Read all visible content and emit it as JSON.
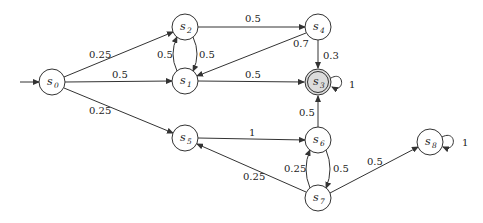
{
  "diagram": {
    "type": "markov-chain",
    "colors": {
      "stroke": "#333333",
      "node_fill": "#ffffff",
      "accepting_fill": "#dcdcdc",
      "background": "#ffffff"
    },
    "initial_state": "s0",
    "nodes": [
      {
        "id": "s0",
        "label": "s",
        "sub": "0",
        "x": 52,
        "y": 82,
        "accepting": false
      },
      {
        "id": "s1",
        "label": "s",
        "sub": "1",
        "x": 185,
        "y": 81,
        "accepting": false
      },
      {
        "id": "s2",
        "label": "s",
        "sub": "2",
        "x": 185,
        "y": 27,
        "accepting": false
      },
      {
        "id": "s3",
        "label": "s",
        "sub": "3",
        "x": 318,
        "y": 82,
        "accepting": true
      },
      {
        "id": "s4",
        "label": "s",
        "sub": "4",
        "x": 318,
        "y": 27,
        "accepting": false
      },
      {
        "id": "s5",
        "label": "s",
        "sub": "5",
        "x": 185,
        "y": 138,
        "accepting": false
      },
      {
        "id": "s6",
        "label": "s",
        "sub": "6",
        "x": 318,
        "y": 140,
        "accepting": false
      },
      {
        "id": "s7",
        "label": "s",
        "sub": "7",
        "x": 318,
        "y": 198,
        "accepting": false
      },
      {
        "id": "s8",
        "label": "s",
        "sub": "8",
        "x": 430,
        "y": 142,
        "accepting": false
      }
    ],
    "edges": [
      {
        "from": "s0",
        "to": "s2",
        "prob": "0.25"
      },
      {
        "from": "s0",
        "to": "s1",
        "prob": "0.5"
      },
      {
        "from": "s0",
        "to": "s5",
        "prob": "0.25"
      },
      {
        "from": "s2",
        "to": "s4",
        "prob": "0.5"
      },
      {
        "from": "s2",
        "to": "s1",
        "prob": "0.5"
      },
      {
        "from": "s1",
        "to": "s2",
        "prob": "0.5"
      },
      {
        "from": "s1",
        "to": "s3",
        "prob": "0.5"
      },
      {
        "from": "s4",
        "to": "s1",
        "prob": "0.7"
      },
      {
        "from": "s4",
        "to": "s3",
        "prob": "0.3"
      },
      {
        "from": "s3",
        "to": "s3",
        "prob": "1"
      },
      {
        "from": "s5",
        "to": "s6",
        "prob": "1"
      },
      {
        "from": "s6",
        "to": "s3",
        "prob": "0.5"
      },
      {
        "from": "s6",
        "to": "s7",
        "prob": "0.5"
      },
      {
        "from": "s7",
        "to": "s6",
        "prob": "0.25"
      },
      {
        "from": "s7",
        "to": "s5",
        "prob": "0.25"
      },
      {
        "from": "s7",
        "to": "s8",
        "prob": "0.5"
      },
      {
        "from": "s8",
        "to": "s8",
        "prob": "1"
      }
    ],
    "labels": {
      "e_s0_s2": "0.25",
      "e_s0_s1": "0.5",
      "e_s0_s5": "0.25",
      "e_s2_s4": "0.5",
      "e_s2_s1": "0.5",
      "e_s1_s2": "0.5",
      "e_s1_s3": "0.5",
      "e_s4_s1": "0.7",
      "e_s4_s3": "0.3",
      "e_s3_s3": "1",
      "e_s5_s6": "1",
      "e_s6_s3": "0.5",
      "e_s6_s7": "0.5",
      "e_s7_s6": "0.25",
      "e_s7_s5": "0.25",
      "e_s7_s8": "0.5",
      "e_s8_s8": "1"
    },
    "node_text": {
      "s0": {
        "name": "s",
        "sub": "0"
      },
      "s1": {
        "name": "s",
        "sub": "1"
      },
      "s2": {
        "name": "s",
        "sub": "2"
      },
      "s3": {
        "name": "s",
        "sub": "3"
      },
      "s4": {
        "name": "s",
        "sub": "4"
      },
      "s5": {
        "name": "s",
        "sub": "5"
      },
      "s6": {
        "name": "s",
        "sub": "6"
      },
      "s7": {
        "name": "s",
        "sub": "7"
      },
      "s8": {
        "name": "s",
        "sub": "8"
      }
    }
  }
}
